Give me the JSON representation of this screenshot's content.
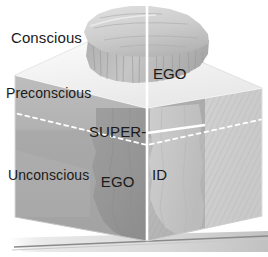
{
  "diagram": {
    "levels_of_awareness": [
      {
        "id": "conscious",
        "label": "Conscious"
      },
      {
        "id": "preconscious",
        "label": "Preconscious"
      },
      {
        "id": "unconscious",
        "label": "Unconscious"
      }
    ],
    "structures": [
      {
        "id": "ego",
        "label": "EGO"
      },
      {
        "id": "superego",
        "label_line1": "SUPER-",
        "label_line2": "EGO"
      },
      {
        "id": "id",
        "label": "ID"
      }
    ],
    "colors": {
      "background": "#ffffff",
      "top_face": "#f2f2f2",
      "left_face_upper": "#b9b9b9",
      "left_face_lower": "#a6a6a6",
      "right_face": "#d2d2d2",
      "right_face_hatch": "#c4c4c4",
      "inner_wall": "#9a9a9a",
      "iceberg_light": "#d9d9d9",
      "iceberg_mid": "#bdbdbd",
      "iceberg_dark": "#9e9e9e",
      "divider_line": "#ffffff",
      "dashed_line": "#ffffff",
      "ground_line": "#8a8a8a",
      "text": "#1a1a1a"
    }
  }
}
